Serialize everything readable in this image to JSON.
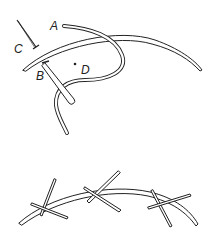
{
  "diagram": {
    "colors": {
      "line": "#222222",
      "fill": "#ffffff"
    },
    "top_figure": {
      "labels": {
        "a": "A",
        "b": "B",
        "c": "C",
        "d": "D"
      }
    },
    "bottom_figure": {
      "stitch_count": 3
    }
  }
}
